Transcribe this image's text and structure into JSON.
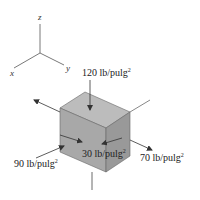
{
  "axes": {
    "x_label": "x",
    "y_label": "y",
    "z_label": "z"
  },
  "stresses": {
    "top": {
      "value": "120 lb/pulg",
      "exponent": "2"
    },
    "left": {
      "value": "90 lb/pulg",
      "exponent": "2"
    },
    "front": {
      "value": "30 lb/pulg",
      "exponent": "2"
    },
    "right": {
      "value": "70 lb/pulg",
      "exponent": "2"
    }
  },
  "colors": {
    "cube_top": "#b8b8b8",
    "cube_front": "#a9a9a9",
    "cube_side": "#9a9a9a",
    "lines": "#333333"
  }
}
